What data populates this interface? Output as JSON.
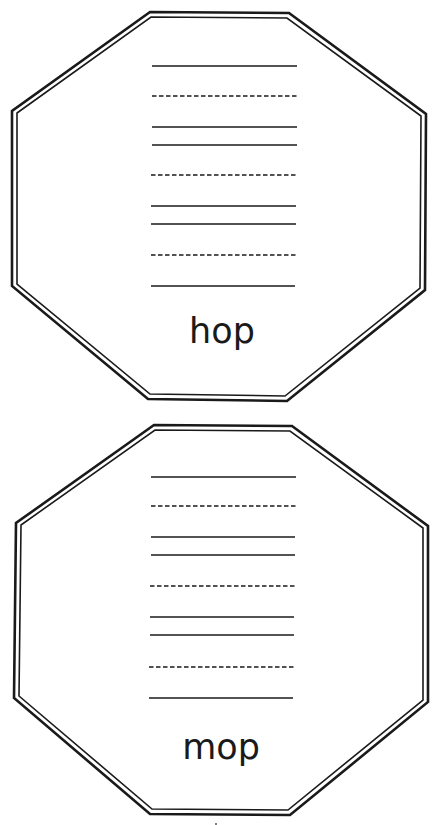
{
  "worksheet": {
    "cards": [
      {
        "word": "hop",
        "outer": "150,12 289,13 426,114 425,290 287,401 148,399 12,286 12,111",
        "inner": "151,17 287,18 421,116 420,288 285,396 150,394 17,284 17,113",
        "lines": [
          {
            "y": 66,
            "x1": 152,
            "x2": 297,
            "style": "solid"
          },
          {
            "y": 96,
            "x1": 152,
            "x2": 297,
            "style": "dashed"
          },
          {
            "y": 127,
            "x1": 152,
            "x2": 297,
            "style": "solid"
          },
          {
            "y": 145,
            "x1": 152,
            "x2": 297,
            "style": "solid"
          },
          {
            "y": 175,
            "x1": 151,
            "x2": 296,
            "style": "dashed"
          },
          {
            "y": 206,
            "x1": 151,
            "x2": 296,
            "style": "solid"
          },
          {
            "y": 224,
            "x1": 151,
            "x2": 296,
            "style": "solid"
          },
          {
            "y": 255,
            "x1": 151,
            "x2": 296,
            "style": "dashed"
          },
          {
            "y": 286,
            "x1": 151,
            "x2": 295,
            "style": "solid"
          }
        ],
        "word_x": 222,
        "word_y": 343
      },
      {
        "word": "mop",
        "outer": "154,425 292,426 428,526 428,702 290,815 150,814 14,698 16,523",
        "inner": "155,430 290,431 423,528 423,700 288,810 152,809 19,696 21,525",
        "lines": [
          {
            "y": 477,
            "x1": 151,
            "x2": 296,
            "style": "solid"
          },
          {
            "y": 506,
            "x1": 151,
            "x2": 296,
            "style": "dashed"
          },
          {
            "y": 537,
            "x1": 151,
            "x2": 295,
            "style": "solid"
          },
          {
            "y": 555,
            "x1": 151,
            "x2": 295,
            "style": "solid"
          },
          {
            "y": 586,
            "x1": 150,
            "x2": 295,
            "style": "dashed"
          },
          {
            "y": 617,
            "x1": 150,
            "x2": 294,
            "style": "solid"
          },
          {
            "y": 635,
            "x1": 150,
            "x2": 294,
            "style": "solid"
          },
          {
            "y": 667,
            "x1": 149,
            "x2": 294,
            "style": "dashed"
          },
          {
            "y": 698,
            "x1": 149,
            "x2": 293,
            "style": "solid"
          }
        ],
        "word_x": 221,
        "word_y": 759
      }
    ],
    "colors": {
      "ink": "#1a1a1a",
      "paper": "#ffffff"
    }
  }
}
